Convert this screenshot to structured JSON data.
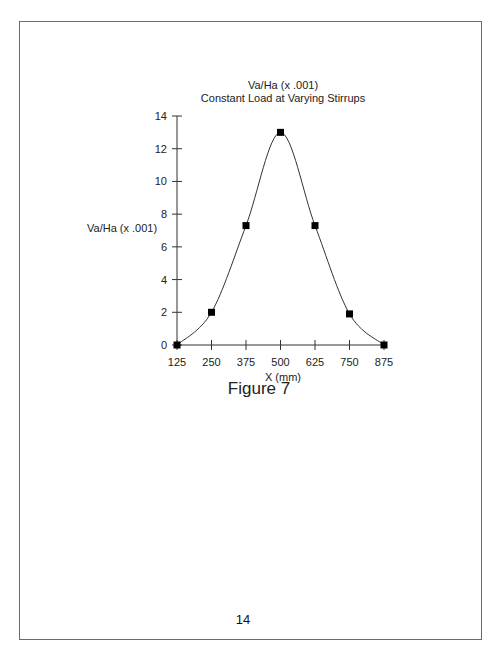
{
  "page": {
    "page_number": "14",
    "figure_caption": "Figure 7"
  },
  "chart_data": {
    "type": "line",
    "title": "Va/Ha (x .001)",
    "subtitle": "Constant Load at Varying Stirrups",
    "xlabel": "X (mm)",
    "ylabel": "Va/Ha (x .001)",
    "x": [
      125,
      250,
      375,
      500,
      625,
      750,
      875
    ],
    "series": [
      {
        "name": "Va/Ha (x .001)",
        "values": [
          0.0,
          2.0,
          7.3,
          13.0,
          7.3,
          1.9,
          0.0
        ],
        "marker": "square",
        "line": "smooth",
        "color": "#000000"
      }
    ],
    "x_ticks": [
      "125",
      "250",
      "375",
      "500",
      "625",
      "750",
      "875"
    ],
    "y_ticks": [
      "0",
      "2",
      "4",
      "6",
      "8",
      "10",
      "12",
      "14"
    ],
    "xlim": [
      125,
      875
    ],
    "ylim": [
      0,
      14
    ],
    "grid": false,
    "legend": "none"
  },
  "colors": {
    "line": "#333333",
    "marker": "#000000",
    "axis": "#333333",
    "frame": "#6a6a6a"
  }
}
